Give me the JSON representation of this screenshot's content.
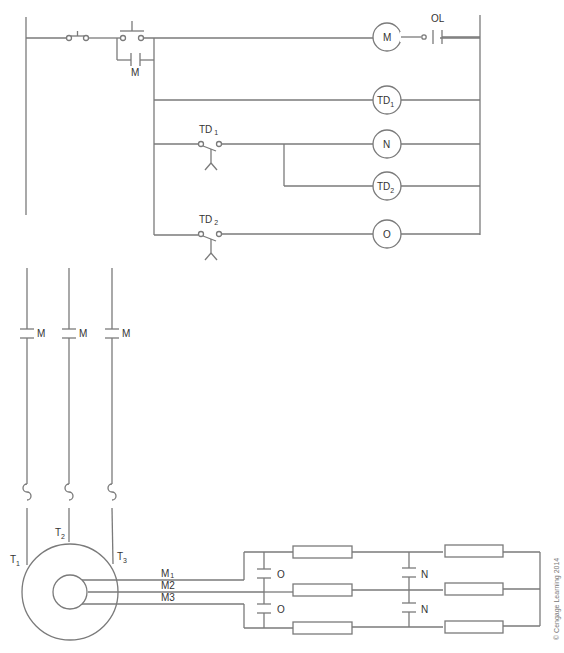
{
  "diagram": {
    "type": "ladder-and-wiring-schematic",
    "control_circuit": {
      "rungs": [
        {
          "id": "rung1",
          "elements": [
            "stop-pb",
            "start-pb",
            "M-seal-contact",
            "M-coil",
            "OL-contact"
          ],
          "labels": {
            "seal_contact": "M",
            "coil": "M",
            "overload": "OL"
          }
        },
        {
          "id": "rung2",
          "elements": [
            "TD1-coil"
          ],
          "labels": {
            "coil_main": "TD",
            "coil_sub": "1"
          }
        },
        {
          "id": "rung3",
          "elements": [
            "TD1-timed-contact",
            "N-coil"
          ],
          "labels": {
            "contact_main": "TD",
            "contact_sub": "1",
            "coil": "N"
          }
        },
        {
          "id": "rung4",
          "elements": [
            "TD2-coil"
          ],
          "labels": {
            "coil_main": "TD",
            "coil_sub": "2"
          }
        },
        {
          "id": "rung5",
          "elements": [
            "TD2-timed-contact",
            "O-coil"
          ],
          "labels": {
            "contact_main": "TD",
            "contact_sub": "2",
            "coil": "O"
          }
        }
      ]
    },
    "power_circuit": {
      "line_contacts": [
        "M",
        "M",
        "M"
      ],
      "motor_terminals": [
        {
          "main": "T",
          "sub": "1"
        },
        {
          "main": "T",
          "sub": "2"
        },
        {
          "main": "T",
          "sub": "3"
        }
      ],
      "rotor_leads": [
        {
          "main": "M",
          "sub": "1"
        },
        {
          "main": "M",
          "sub": "2"
        },
        {
          "main": "M",
          "sub": "3"
        }
      ],
      "resistor_contacts": {
        "stage1": [
          "O",
          "O"
        ],
        "stage2": [
          "N",
          "N"
        ]
      },
      "resistor_banks": 2,
      "resistors_per_bank": 3
    },
    "credit": "© Cengage Learning 2014"
  }
}
